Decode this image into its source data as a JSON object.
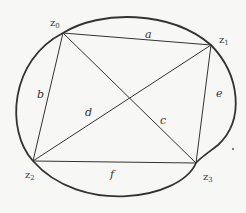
{
  "diagram": {
    "vertices": [
      {
        "id": "z0",
        "base": "z",
        "sub": "0",
        "x": 63,
        "y": 33,
        "lx": 50,
        "ly": 26
      },
      {
        "id": "z1",
        "base": "z",
        "sub": "1",
        "x": 211,
        "y": 45,
        "lx": 219,
        "ly": 43
      },
      {
        "id": "z2",
        "base": "z",
        "sub": "2",
        "x": 33,
        "y": 161,
        "lx": 25,
        "ly": 178
      },
      {
        "id": "z3",
        "base": "z",
        "sub": "3",
        "x": 196,
        "y": 163,
        "lx": 203,
        "ly": 180
      }
    ],
    "edges": [
      {
        "label": "a",
        "from": "z0",
        "to": "z1",
        "lx": 145,
        "ly": 38
      },
      {
        "label": "b",
        "from": "z0",
        "to": "z2",
        "lx": 37,
        "ly": 98
      },
      {
        "label": "c",
        "from": "z0",
        "to": "z3",
        "lx": 160,
        "ly": 124
      },
      {
        "label": "d",
        "from": "z1",
        "to": "z2",
        "lx": 85,
        "ly": 116
      },
      {
        "label": "e",
        "from": "z1",
        "to": "z3",
        "lx": 216,
        "ly": 97
      },
      {
        "label": "f",
        "from": "z2",
        "to": "z3",
        "lx": 110,
        "ly": 178
      }
    ],
    "dot": {
      "x": 233,
      "y": 149
    }
  }
}
